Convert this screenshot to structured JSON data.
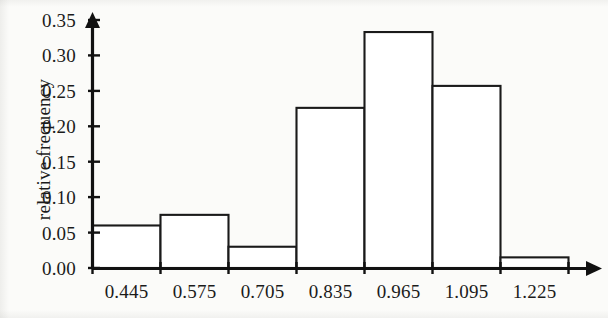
{
  "chart_data": {
    "type": "bar",
    "title": "",
    "subtitle": "",
    "xlabel": "",
    "ylabel": "relative frequency",
    "categories": [
      "0.445",
      "0.575",
      "0.705",
      "0.835",
      "0.965",
      "1.095",
      "1.225"
    ],
    "values": [
      0.06,
      0.075,
      0.03,
      0.226,
      0.333,
      0.257,
      0.015
    ],
    "xlim": [
      0.38,
      1.29
    ],
    "ylim": [
      0.0,
      0.35
    ],
    "bin_width": 0.13,
    "x_tick_labels": [
      "0.445",
      "0.575",
      "0.705",
      "0.835",
      "0.965",
      "1.095",
      "1.225"
    ],
    "y_tick_labels": [
      "0.00",
      "0.05",
      "0.10",
      "0.15",
      "0.20",
      "0.25",
      "0.30",
      "0.35"
    ],
    "y_tick_values": [
      0.0,
      0.05,
      0.1,
      0.15,
      0.2,
      0.25,
      0.3,
      0.35
    ],
    "grid": false,
    "legend": null,
    "legend_position": "none",
    "bar_fill_color": "#ffffff",
    "bar_edge_color": "#1a1a1a",
    "axis_color": "#111111",
    "background_color": "#fbfbf9",
    "axis_arrowheads": true,
    "bars_centered_on_ticks": true,
    "annotations": []
  }
}
